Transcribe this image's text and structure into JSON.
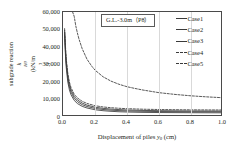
{
  "chart_data": {
    "type": "line",
    "title": "",
    "annotation": "G.L.-3.0m（P8）",
    "xlabel_parts": {
      "pre": "Displacement of piles ",
      "sym": "y",
      "sub": "0",
      "post": " (cm)"
    },
    "ylabel_line1": "Coefficient of static-horizontal",
    "ylabel_line2_pre": "subgrade reaction ",
    "ylabel_sym": "k",
    "ylabel_sub": "H0",
    "ylabel_unit_pre": " (kN/m",
    "ylabel_unit_sup": "3",
    "ylabel_unit_post": ")",
    "xlim": [
      0.0,
      1.0
    ],
    "ylim": [
      0,
      60000
    ],
    "xticks": [
      0.0,
      0.2,
      0.4,
      0.6,
      0.8,
      1.0
    ],
    "xticklabels": [
      "0.0",
      "0.2",
      "0.4",
      "0.6",
      "0.8",
      "1.0"
    ],
    "yticks": [
      0,
      10000,
      20000,
      30000,
      40000,
      50000,
      60000
    ],
    "yticklabels": [
      "0",
      "10,000",
      "20,000",
      "30,000",
      "40,000",
      "50,000",
      "60,000"
    ],
    "grid": "vertical-light",
    "legend_position": "right-outside",
    "series": [
      {
        "name": "Case1",
        "style": "solid",
        "color": "#3a3a3a",
        "x": [
          0.01,
          0.015,
          0.02,
          0.03,
          0.04,
          0.05,
          0.07,
          0.09,
          0.12,
          0.15,
          0.2,
          0.25,
          0.3,
          0.35,
          0.4,
          0.5,
          0.6,
          0.7,
          0.8,
          0.9,
          1.0
        ],
        "values": [
          47000,
          36000,
          28500,
          20000,
          15500,
          12700,
          9500,
          7700,
          6100,
          5150,
          4150,
          3600,
          3250,
          3000,
          2850,
          2650,
          2550,
          2500,
          2450,
          2420,
          2400
        ]
      },
      {
        "name": "Case2",
        "style": "solid",
        "color": "#3a3a3a",
        "x": [
          0.01,
          0.015,
          0.02,
          0.03,
          0.04,
          0.05,
          0.07,
          0.09,
          0.12,
          0.15,
          0.2,
          0.25,
          0.3,
          0.35,
          0.4,
          0.5,
          0.6,
          0.7,
          0.8,
          0.9,
          1.0
        ],
        "values": [
          48500,
          38000,
          30500,
          22000,
          17200,
          14200,
          10700,
          8800,
          7050,
          6000,
          4900,
          4300,
          3900,
          3650,
          3450,
          3250,
          3120,
          3050,
          3000,
          2970,
          2950
        ]
      },
      {
        "name": "Case3",
        "style": "solid",
        "color": "#3a3a3a",
        "x": [
          0.01,
          0.015,
          0.02,
          0.03,
          0.04,
          0.05,
          0.07,
          0.09,
          0.12,
          0.15,
          0.2,
          0.25,
          0.3,
          0.35,
          0.4,
          0.5,
          0.6,
          0.7,
          0.8,
          0.9,
          1.0
        ],
        "values": [
          49500,
          39500,
          32000,
          23500,
          18600,
          15500,
          11800,
          9800,
          7950,
          6800,
          5600,
          4950,
          4520,
          4230,
          4020,
          3760,
          3620,
          3520,
          3460,
          3420,
          3390
        ]
      },
      {
        "name": "Case4",
        "style": "dashed",
        "color": "#3a3a3a",
        "x": [
          0.06,
          0.07,
          0.08,
          0.09,
          0.1,
          0.12,
          0.15,
          0.18,
          0.2,
          0.25,
          0.3,
          0.35,
          0.4,
          0.45,
          0.5,
          0.6,
          0.7,
          0.8,
          0.9,
          1.0
        ],
        "values": [
          60000,
          57500,
          52000,
          48000,
          44500,
          39000,
          33000,
          29000,
          26800,
          23000,
          20500,
          18700,
          17300,
          16300,
          15400,
          13900,
          12900,
          12100,
          11500,
          11000
        ]
      },
      {
        "name": "Case5",
        "style": "dashed",
        "color": "#3a3a3a",
        "x": [
          0.01,
          0.015,
          0.02,
          0.03,
          0.04,
          0.05,
          0.07,
          0.09,
          0.12,
          0.15,
          0.2,
          0.25,
          0.3,
          0.35,
          0.4,
          0.5,
          0.6,
          0.7,
          0.8,
          0.9,
          1.0
        ],
        "values": [
          50500,
          41000,
          33500,
          25000,
          20000,
          16800,
          13000,
          10900,
          8950,
          7750,
          6450,
          5750,
          5300,
          4980,
          4750,
          4450,
          4280,
          4170,
          4090,
          4040,
          4000
        ]
      }
    ]
  },
  "legend": {
    "items": [
      {
        "label": "Case1"
      },
      {
        "label": "Case2"
      },
      {
        "label": "Case3"
      },
      {
        "label": "Case4"
      },
      {
        "label": "Case5"
      }
    ]
  }
}
